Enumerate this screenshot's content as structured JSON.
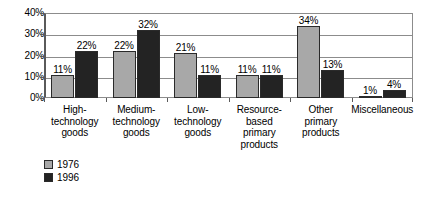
{
  "chart_data": {
    "type": "bar",
    "title": "",
    "xlabel": "",
    "ylabel": "",
    "ylim": [
      0,
      40
    ],
    "ytick_labels": [
      "0%",
      "10%",
      "20%",
      "30%",
      "40%"
    ],
    "ytick_values": [
      0,
      10,
      20,
      30,
      40
    ],
    "grid": true,
    "legend_position": "bottom-left",
    "value_label_suffix": "%",
    "categories": [
      "High-\ntechnology\ngoods",
      "Medium-\ntechnology\ngoods",
      "Low-\ntechnology\ngoods",
      "Resource-\nbased\nprimary\nproducts",
      "Other\nprimary\nproducts",
      "Miscellaneous"
    ],
    "category_lines": [
      [
        "High-",
        "technology",
        "goods"
      ],
      [
        "Medium-",
        "technology",
        "goods"
      ],
      [
        "Low-",
        "technology",
        "goods"
      ],
      [
        "Resource-",
        "based",
        "primary",
        "products"
      ],
      [
        "Other",
        "primary",
        "products"
      ],
      [
        "Miscellaneous"
      ]
    ],
    "series": [
      {
        "name": "1976",
        "color": "#a8a8a8",
        "values": [
          11,
          22,
          21,
          11,
          34,
          1
        ],
        "labels": [
          "11%",
          "22%",
          "21%",
          "11%",
          "34%",
          "1%"
        ]
      },
      {
        "name": "1996",
        "color": "#232323",
        "values": [
          22,
          32,
          11,
          11,
          13,
          4
        ],
        "labels": [
          "22%",
          "32%",
          "11%",
          "11%",
          "13%",
          "4%"
        ]
      }
    ]
  },
  "legend": {
    "items": [
      {
        "label": "1976",
        "color": "#a8a8a8"
      },
      {
        "label": "1996",
        "color": "#232323"
      }
    ]
  }
}
